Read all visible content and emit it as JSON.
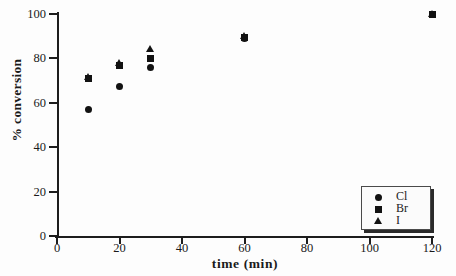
{
  "chart_data": {
    "type": "scatter",
    "title": "",
    "xlabel": "time  (min)",
    "ylabel": "% conversion",
    "xlim": [
      0,
      120
    ],
    "ylim": [
      0,
      100
    ],
    "xticks": [
      0,
      20,
      40,
      60,
      80,
      100,
      120
    ],
    "yticks": [
      0,
      20,
      40,
      60,
      80,
      100
    ],
    "xtick_labels": [
      "0",
      "20",
      "40",
      "60",
      "80",
      "100",
      "120"
    ],
    "ytick_labels": [
      "0",
      "20",
      "40",
      "60",
      "80",
      "100"
    ],
    "grid": false,
    "legend_position": "bottom-right",
    "series": [
      {
        "name": "Cl",
        "marker": "circle",
        "color": "#121212",
        "points": [
          {
            "x": 10,
            "y": 57
          },
          {
            "x": 20,
            "y": 67.5
          },
          {
            "x": 30,
            "y": 76
          },
          {
            "x": 60,
            "y": 89
          },
          {
            "x": 120,
            "y": 100
          }
        ]
      },
      {
        "name": "Br",
        "marker": "square",
        "color": "#121212",
        "points": [
          {
            "x": 10,
            "y": 71
          },
          {
            "x": 20,
            "y": 77
          },
          {
            "x": 30,
            "y": 80
          },
          {
            "x": 60,
            "y": 89.5
          },
          {
            "x": 120,
            "y": 100
          }
        ]
      },
      {
        "name": "I",
        "marker": "triangle",
        "color": "#121212",
        "points": [
          {
            "x": 10,
            "y": 71.5
          },
          {
            "x": 20,
            "y": 78
          },
          {
            "x": 30,
            "y": 84
          },
          {
            "x": 60,
            "y": 90
          },
          {
            "x": 120,
            "y": 100
          }
        ]
      }
    ]
  },
  "legend": {
    "entries": [
      {
        "label": "Cl",
        "marker": "circle"
      },
      {
        "label": "Br",
        "marker": "square"
      },
      {
        "label": "I",
        "marker": "triangle"
      }
    ]
  }
}
